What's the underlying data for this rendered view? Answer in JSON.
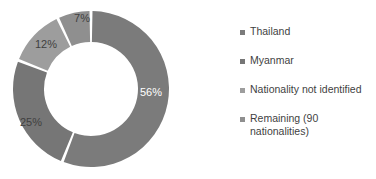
{
  "background_color": "#ffffff",
  "chart_data": {
    "type": "pie",
    "variant": "donut",
    "title": "",
    "subtitle": "",
    "xlabel": "",
    "ylabel": "",
    "legend_position": "right",
    "grid": false,
    "start_angle_deg": 0,
    "direction": "clockwise",
    "center": {
      "x": 91,
      "y": 89
    },
    "outer_radius": 78,
    "inner_radius": 47,
    "gap_color": "#ffffff",
    "categories": [
      "Thailand",
      "Myanmar",
      "Nationality not identified",
      "Remaining (90 nationalities)"
    ],
    "values": [
      56,
      25,
      12,
      7
    ],
    "value_unit": "%",
    "data_labels": [
      "56%",
      "25%",
      "12%",
      "7%"
    ],
    "colors": [
      "#7b7b7b",
      "#767676",
      "#9d9d9d",
      "#8f8f8f"
    ],
    "label_colors": [
      "#ffffff",
      "#3f3f3f",
      "#3f3f3f",
      "#3f3f3f"
    ],
    "slices": [
      {
        "name": "Thailand",
        "value": 56,
        "label": "56%",
        "color": "#7b7b7b",
        "label_color": "#ffffff",
        "label_x": 151,
        "label_y": 93
      },
      {
        "name": "Myanmar",
        "value": 25,
        "label": "25%",
        "color": "#767676",
        "label_color": "#3f3f3f",
        "label_x": 31,
        "label_y": 123
      },
      {
        "name": "Nationality not identified",
        "value": 12,
        "label": "12%",
        "color": "#9d9d9d",
        "label_color": "#3f3f3f",
        "label_x": 46,
        "label_y": 45
      },
      {
        "name": "Remaining (90 nationalities)",
        "value": 7,
        "label": "7%",
        "color": "#8f8f8f",
        "label_color": "#3f3f3f",
        "label_x": 82,
        "label_y": 19
      }
    ]
  },
  "legend": {
    "items": [
      {
        "label": "Thailand",
        "color": "#7b7b7b",
        "top": 25
      },
      {
        "label": "Myanmar",
        "color": "#767676",
        "top": 54
      },
      {
        "label": "Nationality not identified",
        "color": "#9d9d9d",
        "top": 83
      },
      {
        "label": "Remaining (90\nnationalities)",
        "color": "#8f8f8f",
        "top": 112
      }
    ]
  }
}
